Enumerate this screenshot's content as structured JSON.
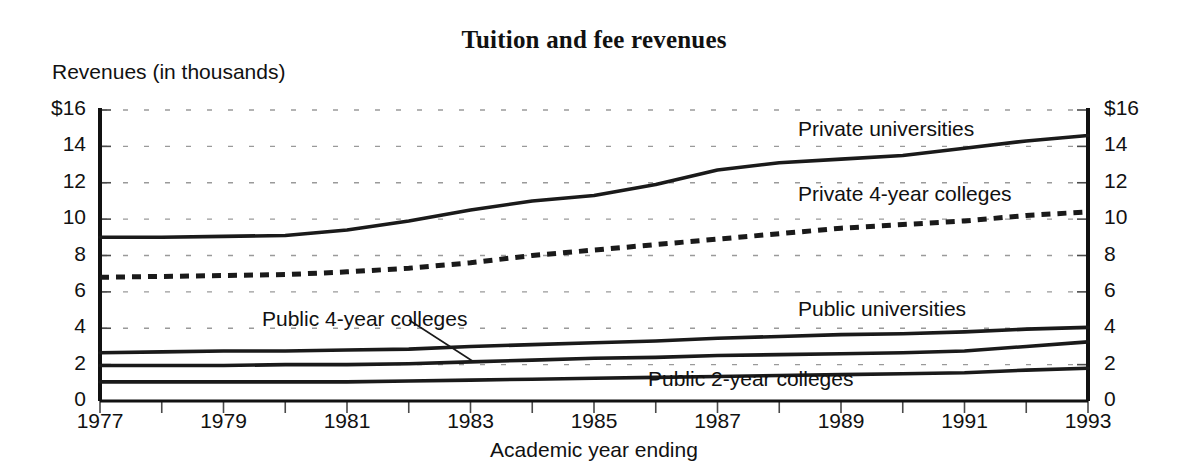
{
  "chart_data": {
    "type": "line",
    "title": "Tuition and fee revenues",
    "xlabel": "Academic year ending",
    "ylabel": "Revenues (in thousands)",
    "xlim": [
      1977,
      1993
    ],
    "ylim": [
      0,
      16
    ],
    "grid": true,
    "legend_position": "inline-labels",
    "y_tick_labels_left": [
      "$16",
      "14",
      "12",
      "10",
      "8",
      "6",
      "4",
      "2",
      "0"
    ],
    "y_tick_labels_right": [
      "$16",
      "14",
      "12",
      "10",
      "8",
      "6",
      "4",
      "2",
      "0"
    ],
    "y_tick_values": [
      16,
      14,
      12,
      10,
      8,
      6,
      4,
      2,
      0
    ],
    "x_tick_labels": [
      "1977",
      "1979",
      "1981",
      "1983",
      "1985",
      "1987",
      "1989",
      "1991",
      "1993"
    ],
    "x_tick_values": [
      1977,
      1979,
      1981,
      1983,
      1985,
      1987,
      1989,
      1991,
      1993
    ],
    "x_minor_tick_values": [
      1978,
      1980,
      1982,
      1984,
      1986,
      1988,
      1990,
      1992
    ],
    "x": [
      1977,
      1978,
      1979,
      1980,
      1981,
      1982,
      1983,
      1984,
      1985,
      1986,
      1987,
      1988,
      1989,
      1990,
      1991,
      1992,
      1993
    ],
    "series": [
      {
        "name": "Private universities",
        "style": "solid",
        "color": "#1a1a1a",
        "values": [
          9.0,
          9.0,
          9.05,
          9.1,
          9.4,
          9.9,
          10.5,
          11.0,
          11.3,
          11.9,
          12.7,
          13.1,
          13.3,
          13.5,
          13.9,
          14.3,
          14.6
        ]
      },
      {
        "name": "Private 4-year colleges",
        "style": "dashed",
        "color": "#1a1a1a",
        "values": [
          6.8,
          6.85,
          6.9,
          6.95,
          7.1,
          7.3,
          7.6,
          8.0,
          8.3,
          8.6,
          8.9,
          9.2,
          9.5,
          9.7,
          9.9,
          10.2,
          10.4
        ]
      },
      {
        "name": "Public universities",
        "style": "solid",
        "color": "#1a1a1a",
        "values": [
          2.65,
          2.7,
          2.75,
          2.75,
          2.8,
          2.85,
          3.0,
          3.1,
          3.2,
          3.3,
          3.45,
          3.55,
          3.65,
          3.7,
          3.8,
          3.95,
          4.05
        ]
      },
      {
        "name": "Public 4-year colleges",
        "style": "solid",
        "color": "#1a1a1a",
        "values": [
          1.95,
          1.95,
          1.95,
          2.0,
          2.0,
          2.05,
          2.15,
          2.25,
          2.35,
          2.4,
          2.5,
          2.55,
          2.6,
          2.65,
          2.75,
          3.0,
          3.25
        ]
      },
      {
        "name": "Public 2-year colleges",
        "style": "solid",
        "color": "#1a1a1a",
        "values": [
          1.05,
          1.05,
          1.05,
          1.05,
          1.05,
          1.1,
          1.15,
          1.2,
          1.25,
          1.3,
          1.35,
          1.4,
          1.45,
          1.5,
          1.55,
          1.7,
          1.8
        ]
      }
    ],
    "annotations": [
      {
        "text": "Private universities",
        "x": 798,
        "y": 117
      },
      {
        "text": "Private 4-year colleges",
        "x": 798,
        "y": 182
      },
      {
        "text": "Public universities",
        "x": 798,
        "y": 297
      },
      {
        "text": "Public 4-year colleges",
        "x": 262,
        "y": 307
      },
      {
        "text": "Public 2-year colleges",
        "x": 648,
        "y": 367
      }
    ]
  }
}
